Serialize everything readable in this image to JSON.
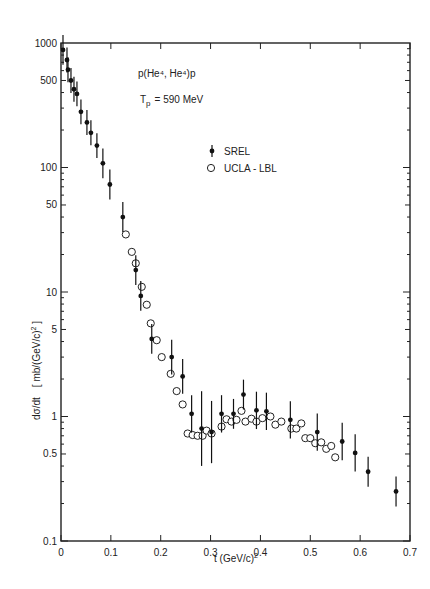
{
  "chart_data": {
    "type": "scatter",
    "title": "",
    "annotations": [
      "p(He⁴, He⁴)p",
      "T_p = 590 MeV"
    ],
    "xlabel": "t (GeV/c)²",
    "ylabel": "dσ/dt  [mb/(GeV/c)²]",
    "xlim": [
      0,
      0.7
    ],
    "ylim": [
      0.1,
      1000
    ],
    "yscale": "log",
    "grid": false,
    "legend_position": "upper right (inside)",
    "x_ticks": [
      0,
      0.1,
      0.2,
      0.3,
      0.4,
      0.5,
      0.6,
      0.7
    ],
    "x_tick_labels": [
      "0",
      "0.1",
      "0.2",
      "0.3",
      "0.4",
      "0.5",
      "0.6",
      "0.7"
    ],
    "y_ticks": [
      0.1,
      0.5,
      1,
      5,
      10,
      50,
      100,
      500,
      1000
    ],
    "y_tick_labels": [
      "0.1",
      "0.5",
      "1",
      "5",
      "10",
      "50",
      "100",
      "500",
      "1000"
    ],
    "series": [
      {
        "name": "SREL",
        "marker": "filled circle with error bar",
        "x": [
          0.004,
          0.012,
          0.014,
          0.02,
          0.026,
          0.032,
          0.04,
          0.052,
          0.06,
          0.072,
          0.084,
          0.098,
          0.124,
          0.15,
          0.16,
          0.182,
          0.222,
          0.244,
          0.262,
          0.282,
          0.302,
          0.322,
          0.346,
          0.366,
          0.392,
          0.412,
          0.46,
          0.514,
          0.564,
          0.59,
          0.616,
          0.672
        ],
        "y": [
          880,
          730,
          610,
          500,
          425,
          390,
          280,
          230,
          190,
          150,
          108,
          73,
          40,
          15,
          9.3,
          4.2,
          3.0,
          2.1,
          1.05,
          0.8,
          0.75,
          1.05,
          1.05,
          1.5,
          1.12,
          1.1,
          0.94,
          0.75,
          0.63,
          0.51,
          0.36,
          0.25
        ],
        "err": [
          0.12,
          0.1,
          0.1,
          0.1,
          0.1,
          0.1,
          0.1,
          0.1,
          0.1,
          0.1,
          0.12,
          0.12,
          0.12,
          0.12,
          0.12,
          0.12,
          0.14,
          0.14,
          0.15,
          0.3,
          0.25,
          0.15,
          0.12,
          0.12,
          0.15,
          0.15,
          0.15,
          0.15,
          0.15,
          0.15,
          0.12,
          0.12
        ]
      },
      {
        "name": "UCLA - LBL",
        "marker": "open circle",
        "x": [
          0.13,
          0.142,
          0.15,
          0.162,
          0.172,
          0.18,
          0.192,
          0.202,
          0.22,
          0.232,
          0.244,
          0.254,
          0.264,
          0.274,
          0.284,
          0.292,
          0.302,
          0.322,
          0.332,
          0.342,
          0.352,
          0.362,
          0.37,
          0.382,
          0.392,
          0.404,
          0.42,
          0.43,
          0.442,
          0.462,
          0.472,
          0.482,
          0.49,
          0.5,
          0.51,
          0.522,
          0.532,
          0.542,
          0.55
        ],
        "y": [
          29,
          21,
          17,
          11,
          7.9,
          5.6,
          4.1,
          3.0,
          2.2,
          1.6,
          1.25,
          0.73,
          0.71,
          0.7,
          0.7,
          0.77,
          0.73,
          0.83,
          0.95,
          0.91,
          0.94,
          1.11,
          0.91,
          0.96,
          0.91,
          0.97,
          1.0,
          0.86,
          0.91,
          0.8,
          0.8,
          0.88,
          0.67,
          0.67,
          0.61,
          0.62,
          0.55,
          0.58,
          0.47
        ]
      }
    ],
    "legend": [
      {
        "label": "SREL",
        "marker": "filled"
      },
      {
        "label": "UCLA - LBL",
        "marker": "open"
      }
    ]
  },
  "labels": {
    "reaction": "p(He⁴, He⁴)p",
    "energy": "T",
    "energy_sub": "p",
    "energy_value": "= 590 MeV",
    "legend_srel": "SREL",
    "legend_ucla": "UCLA - LBL",
    "xlabel": "t (GeV/c)",
    "xlabel_sup": "2",
    "ylabel_main": "dσ/dt",
    "ylabel_unit": "[ mb/(GeV/c)",
    "ylabel_sup": "2",
    "ylabel_close": " ]"
  }
}
